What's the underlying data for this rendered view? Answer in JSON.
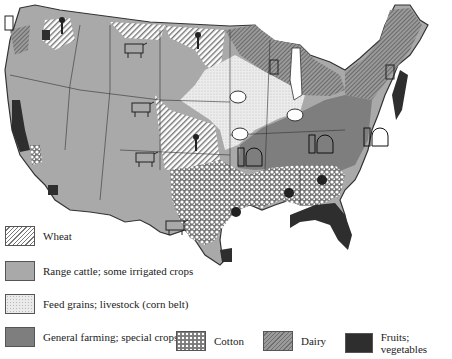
{
  "map": {
    "title": "Agricultural regions of the United States",
    "legend": [
      {
        "key": "wheat",
        "label": "Wheat",
        "pattern": "diagonal-hatch"
      },
      {
        "key": "range",
        "label": "Range cattle; some irrigated crops",
        "color": "#a9a9a9"
      },
      {
        "key": "feed",
        "label": "Feed grains; livestock (corn belt)",
        "color": "#e6e6e6"
      },
      {
        "key": "general",
        "label": "General farming; special crops",
        "color": "#7e7e7e"
      },
      {
        "key": "cotton",
        "label": "Cotton",
        "pattern": "speckled"
      },
      {
        "key": "dairy",
        "label": "Dairy",
        "pattern": "dark-hatch"
      },
      {
        "key": "fruits",
        "label": "Fruits; vegetables",
        "color": "#2e2e2e"
      }
    ],
    "icons": [
      {
        "type": "wheat-sheaf-icon",
        "region": "wheat"
      },
      {
        "type": "cow-icon",
        "region": "range"
      },
      {
        "type": "sheep-icon",
        "region": "feed"
      },
      {
        "type": "barn-silo-icon",
        "region": "general"
      },
      {
        "type": "cotton-boll-icon",
        "region": "cotton"
      },
      {
        "type": "milk-can-icon",
        "region": "dairy"
      }
    ]
  }
}
